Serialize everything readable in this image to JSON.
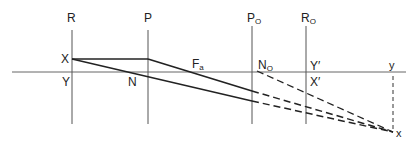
{
  "diagram": {
    "type": "optics-ray-diagram",
    "colors": {
      "line": "#2a2a2a",
      "axis": "#555555",
      "background": "#ffffff"
    },
    "labels": {
      "R": "R",
      "P": "P",
      "P_O": {
        "main": "P",
        "sub": "O"
      },
      "R_O": {
        "main": "R",
        "sub": "O"
      },
      "X": "X",
      "Y": "Y",
      "N": "N",
      "F_a": {
        "main": "F",
        "sub": "a"
      },
      "N_O": {
        "main": "N",
        "sub": "O"
      },
      "Y_prime": "Y′",
      "X_prime": "X′",
      "y": "y",
      "x": "x"
    },
    "planes": [
      "R",
      "P",
      "P_O",
      "R_O"
    ],
    "rays": [
      {
        "name": "parallel-ray",
        "from": "X",
        "via": [
          "P",
          "F_a"
        ],
        "solid_until": "P_O",
        "dashed_to": "x"
      },
      {
        "name": "nodal-ray",
        "from": "X",
        "via": [
          "N"
        ],
        "solid_until": "P_O",
        "dashed_to": "x"
      },
      {
        "name": "emergent-nodal-ray",
        "from": "N_O",
        "dashed_to": "x"
      }
    ]
  }
}
